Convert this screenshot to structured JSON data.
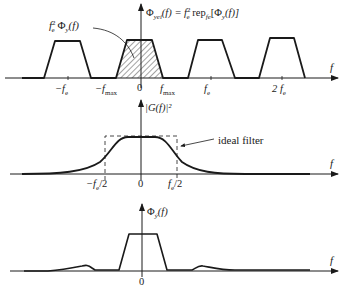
{
  "figure": {
    "panels": [
      {
        "id": "sampled-spectrum",
        "axis_label": "f",
        "formula_main": "Φ",
        "formula_sub": "yei",
        "formula_rest": "(f) = f",
        "formula_fe_sub": "e",
        "formula_sup": "2",
        "formula_rep": " rep",
        "formula_rep_sub": "fe",
        "formula_tail": "[Φ",
        "formula_tail_sub": "y",
        "formula_end": "(f)]",
        "callout_f": "f",
        "callout_sub": "e",
        "callout_sup": "2",
        "callout_phi": " Φ",
        "callout_phi_sub": "y",
        "callout_end": "(f)",
        "ticks": [
          "−f",
          "−f",
          "0",
          "f",
          "f",
          "2 f"
        ],
        "tick_subs": [
          "e",
          "max",
          "",
          "max",
          "e",
          "e"
        ]
      },
      {
        "id": "filter-response",
        "axis_label": "f",
        "title": "|G(f)|²",
        "annotation": "ideal filter",
        "ticks": [
          "−f",
          "0",
          "f"
        ],
        "tick_subs": [
          "e",
          "",
          "e"
        ],
        "tick_suffix": "/2"
      },
      {
        "id": "filtered-spectrum",
        "axis_label": "f",
        "title_phi": "Φ",
        "title_sub": "ỹ",
        "title_end": "(f)",
        "ticks": [
          "0"
        ]
      }
    ],
    "colors": {
      "line": "#1a1a1a",
      "hatch": "#333333",
      "background": "#ffffff"
    }
  }
}
